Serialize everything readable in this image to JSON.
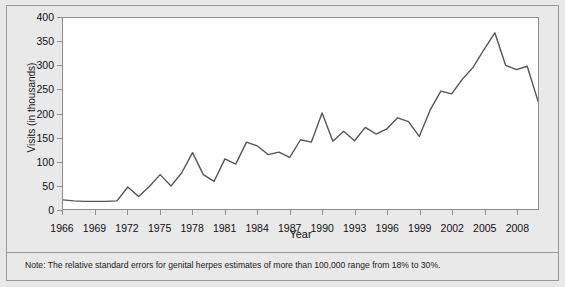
{
  "chart_data": {
    "type": "line",
    "title": "",
    "xlabel": "Year",
    "ylabel": "Visits (in thousands)",
    "ylim": [
      0,
      400
    ],
    "xlim": [
      1966,
      2010
    ],
    "yticks": [
      0,
      50,
      100,
      150,
      200,
      250,
      300,
      350,
      400
    ],
    "xticks": [
      1966,
      1969,
      1972,
      1975,
      1978,
      1981,
      1984,
      1987,
      1990,
      1993,
      1996,
      1999,
      2002,
      2005,
      2008
    ],
    "grid": false,
    "legend": null,
    "line_color": "#555555",
    "x": [
      1966,
      1967,
      1968,
      1969,
      1970,
      1971,
      1972,
      1973,
      1974,
      1975,
      1976,
      1977,
      1978,
      1979,
      1980,
      1981,
      1982,
      1983,
      1984,
      1985,
      1986,
      1987,
      1988,
      1989,
      1990,
      1991,
      1992,
      1993,
      1994,
      1995,
      1996,
      1997,
      1998,
      1999,
      2000,
      2001,
      2002,
      2003,
      2004,
      2005,
      2006,
      2007,
      2008,
      2009,
      2010
    ],
    "values": [
      19,
      17,
      16,
      16,
      16,
      17,
      46,
      26,
      47,
      72,
      48,
      76,
      118,
      72,
      58,
      105,
      94,
      140,
      132,
      114,
      119,
      108,
      145,
      140,
      201,
      142,
      163,
      143,
      171,
      157,
      168,
      191,
      183,
      152,
      207,
      247,
      241,
      272,
      297,
      334,
      369,
      301,
      292,
      299,
      226
    ],
    "annotations": [
      "Note: The relative standard errors for genital herpes estimates of more than 100,000 range from 18% to 30%."
    ]
  },
  "axes": {
    "ylabel": "Visits (in thousands)",
    "xlabel": "Year",
    "ytick_labels": [
      "400",
      "350",
      "300",
      "250",
      "200",
      "150",
      "100",
      "50",
      "0"
    ],
    "xtick_labels": [
      "1966",
      "1969",
      "1972",
      "1975",
      "1978",
      "1981",
      "1984",
      "1987",
      "1990",
      "1993",
      "1996",
      "1999",
      "2002",
      "2005",
      "2008"
    ]
  },
  "note": {
    "text": "Note: The relative standard errors for genital herpes estimates of more than 100,000 range from 18% to 30%."
  }
}
